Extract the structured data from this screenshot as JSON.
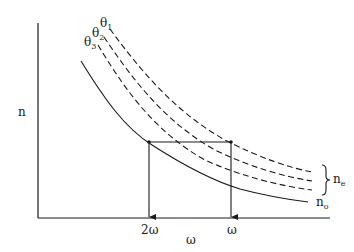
{
  "diagram": {
    "type": "refractive-index-vs-frequency",
    "y_axis_label": "n",
    "x_axis_label": "ω",
    "x_ticks": [
      {
        "label": "2ω",
        "position": "left"
      },
      {
        "label": "ω",
        "position": "right"
      }
    ],
    "curves": [
      {
        "name": "θ1",
        "label_main": "θ",
        "label_sub": "1",
        "style": "dashed"
      },
      {
        "name": "θ2",
        "label_main": "θ",
        "label_sub": "2",
        "style": "dashed"
      },
      {
        "name": "θ3",
        "label_main": "θ",
        "label_sub": "3",
        "style": "dashed"
      },
      {
        "name": "no",
        "label_main": "n",
        "label_sub": "o",
        "style": "solid"
      }
    ],
    "brace_label_main": "n",
    "brace_label_sub": "e",
    "annotations": [
      "Horizontal line connects n_o at 2ω with n_e curve at ω (phase matching)",
      "Vertical arrows drop from the two intersection points to the ω axis"
    ],
    "colors": {
      "line": "#1a1a1a",
      "background": "#ffffff"
    }
  }
}
